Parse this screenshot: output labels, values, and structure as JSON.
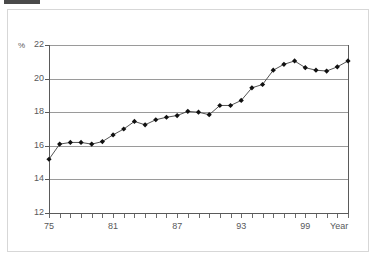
{
  "figure": {
    "unit_label": "%",
    "x_axis_title": "Year"
  },
  "chart_data": {
    "type": "line",
    "title": "",
    "subtitle": "",
    "xlabel": "Year",
    "ylabel": "%",
    "ylim": [
      12,
      22
    ],
    "xlim": [
      1975,
      2003
    ],
    "grid": true,
    "legend": null,
    "y_ticks": [
      12,
      14,
      16,
      18,
      20,
      22
    ],
    "y_tick_labels": [
      "12",
      "14",
      "16",
      "18",
      "20",
      "22"
    ],
    "x_ticks": [
      1975,
      1981,
      1987,
      1993,
      1999
    ],
    "x_tick_labels": [
      "75",
      "81",
      "87",
      "93",
      "99"
    ],
    "marker": "diamond",
    "line_color": "#404040",
    "marker_color": "#111111",
    "grid_color": "#9a9a9a",
    "x": [
      1975,
      1976,
      1977,
      1978,
      1979,
      1980,
      1981,
      1982,
      1983,
      1984,
      1985,
      1986,
      1987,
      1988,
      1989,
      1990,
      1991,
      1992,
      1993,
      1994,
      1995,
      1996,
      1997,
      1998,
      1999,
      2000,
      2001,
      2002,
      2003
    ],
    "values": [
      15.2,
      16.1,
      16.2,
      16.2,
      16.1,
      16.25,
      16.65,
      17.0,
      17.45,
      17.25,
      17.55,
      17.7,
      17.8,
      18.05,
      18.0,
      17.85,
      18.4,
      18.4,
      18.7,
      19.45,
      19.65,
      20.5,
      20.85,
      21.05,
      20.65,
      20.5,
      20.45,
      20.7,
      21.05
    ],
    "series": [
      {
        "name": "rate",
        "values": [
          15.2,
          16.1,
          16.2,
          16.2,
          16.1,
          16.25,
          16.65,
          17.0,
          17.45,
          17.25,
          17.55,
          17.7,
          17.8,
          18.05,
          18.0,
          17.85,
          18.4,
          18.4,
          18.7,
          19.45,
          19.65,
          20.5,
          20.85,
          21.05,
          20.65,
          20.5,
          20.45,
          20.7,
          21.05
        ]
      }
    ]
  }
}
